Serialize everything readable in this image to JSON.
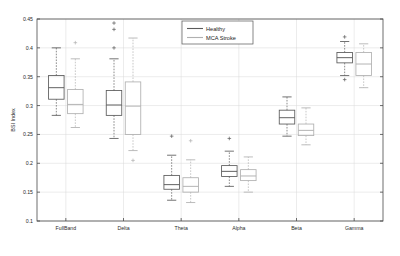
{
  "chart_data": {
    "type": "box",
    "title": "",
    "xlabel": "",
    "ylabel": "BSI Index",
    "ylim": [
      0.1,
      0.45
    ],
    "yticks": [
      0.1,
      0.15,
      0.2,
      0.25,
      0.3,
      0.35,
      0.4,
      0.45
    ],
    "ytick_labels": [
      "0.1",
      "0.15",
      "0.2",
      "0.25",
      "0.3",
      "0.35",
      "0.4",
      "0.45"
    ],
    "categories": [
      "FullBand",
      "Delta",
      "Theta",
      "Alpha",
      "Beta",
      "Gamma"
    ],
    "grid": true,
    "legend_position": "top-center",
    "colors": {
      "healthy": "#5a5a5a",
      "mca_stroke": "#b0b0b0",
      "axis": "#4a4a4a",
      "grid": "#d8d8d8",
      "background": "#ffffff"
    },
    "series": [
      {
        "name": "Healthy",
        "color": "#5a5a5a",
        "boxes": [
          {
            "category": "FullBand",
            "whisker_low": 0.283,
            "q1": 0.311,
            "median": 0.331,
            "q3": 0.352,
            "whisker_high": 0.4,
            "outliers": []
          },
          {
            "category": "Delta",
            "whisker_low": 0.243,
            "q1": 0.283,
            "median": 0.301,
            "q3": 0.326,
            "whisker_high": 0.381,
            "outliers": [
              0.4,
              0.432,
              0.443
            ]
          },
          {
            "category": "Theta",
            "whisker_low": 0.136,
            "q1": 0.155,
            "median": 0.163,
            "q3": 0.179,
            "whisker_high": 0.214,
            "outliers": [
              0.247
            ]
          },
          {
            "category": "Alpha",
            "whisker_low": 0.16,
            "q1": 0.177,
            "median": 0.186,
            "q3": 0.196,
            "whisker_high": 0.221,
            "outliers": [
              0.243
            ]
          },
          {
            "category": "Beta",
            "whisker_low": 0.247,
            "q1": 0.268,
            "median": 0.279,
            "q3": 0.292,
            "whisker_high": 0.315,
            "outliers": []
          },
          {
            "category": "Gamma",
            "whisker_low": 0.352,
            "q1": 0.374,
            "median": 0.383,
            "q3": 0.392,
            "whisker_high": 0.411,
            "outliers": [
              0.419,
              0.345
            ]
          }
        ]
      },
      {
        "name": "MCA Stroke",
        "color": "#b0b0b0",
        "boxes": [
          {
            "category": "FullBand",
            "whisker_low": 0.262,
            "q1": 0.286,
            "median": 0.302,
            "q3": 0.328,
            "whisker_high": 0.381,
            "outliers": [
              0.409
            ]
          },
          {
            "category": "Delta",
            "whisker_low": 0.222,
            "q1": 0.25,
            "median": 0.299,
            "q3": 0.341,
            "whisker_high": 0.417,
            "outliers": [
              0.205
            ]
          },
          {
            "category": "Theta",
            "whisker_low": 0.132,
            "q1": 0.15,
            "median": 0.16,
            "q3": 0.175,
            "whisker_high": 0.206,
            "outliers": [
              0.239
            ]
          },
          {
            "category": "Alpha",
            "whisker_low": 0.15,
            "q1": 0.17,
            "median": 0.178,
            "q3": 0.189,
            "whisker_high": 0.211,
            "outliers": []
          },
          {
            "category": "Beta",
            "whisker_low": 0.232,
            "q1": 0.248,
            "median": 0.257,
            "q3": 0.268,
            "whisker_high": 0.296,
            "outliers": []
          },
          {
            "category": "Gamma",
            "whisker_low": 0.331,
            "q1": 0.352,
            "median": 0.372,
            "q3": 0.392,
            "whisker_high": 0.407,
            "outliers": []
          }
        ]
      }
    ]
  },
  "legend": {
    "items": [
      {
        "label": "Healthy",
        "color": "#5a5a5a"
      },
      {
        "label": "MCA Stroke",
        "color": "#b0b0b0"
      }
    ]
  }
}
